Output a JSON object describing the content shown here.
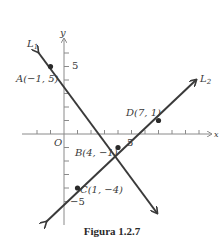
{
  "figure": {
    "caption": "Figura 1.2.7",
    "axes": {
      "x_label": "x",
      "y_label": "y",
      "origin_label": "O",
      "x_tick_label": "5",
      "y_tick_label_pos": "5",
      "y_tick_label_neg": "−5"
    },
    "lines": [
      {
        "name": "L1",
        "label": "L",
        "subscript": "1",
        "through": [
          "A",
          "B"
        ]
      },
      {
        "name": "L2",
        "label": "L",
        "subscript": "2",
        "through": [
          "C",
          "D"
        ]
      }
    ],
    "points": {
      "A": {
        "label": "A(−1, 5)",
        "x": -1,
        "y": 5
      },
      "B": {
        "label": "B(4, −1)",
        "x": 4,
        "y": -1
      },
      "C": {
        "label": "C(1, −4)",
        "x": 1,
        "y": -4
      },
      "D": {
        "label": "D(7, 1)",
        "x": 7,
        "y": 1
      }
    },
    "colors": {
      "line": "#3a3a3a",
      "axis": "#8a8a8a",
      "text": "#3a3a3a"
    }
  }
}
